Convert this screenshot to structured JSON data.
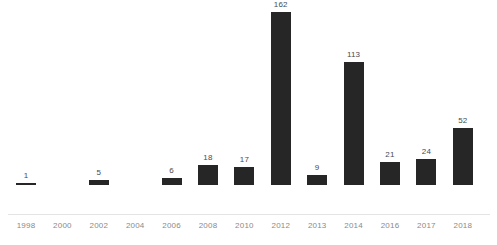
{
  "chart_data": {
    "type": "bar",
    "title": "",
    "subtitle": "",
    "xlabel": "",
    "ylabel": "",
    "grid": false,
    "legend": false,
    "legend_position": "none",
    "axis_line": true,
    "y_axis_visible": false,
    "ylim": [
      0,
      170
    ],
    "bar_color": "#262626",
    "label_color": "#4a4a4a",
    "tick_color": "#8a8a8a",
    "categories": [
      "1998",
      "2000",
      "2002",
      "2004",
      "2006",
      "2008",
      "2010",
      "2012",
      "2013",
      "2014",
      "2016",
      "2017",
      "2018"
    ],
    "values": [
      1,
      null,
      5,
      null,
      6,
      18,
      17,
      162,
      9,
      113,
      21,
      24,
      52
    ],
    "data_labels": [
      "1",
      "",
      "5",
      "",
      "6",
      "18",
      "17",
      "162",
      "9",
      "113",
      "21",
      "24",
      "52"
    ],
    "points": [
      {
        "category": "1998",
        "value": 1,
        "label": "1"
      },
      {
        "category": "2000",
        "value": null,
        "label": ""
      },
      {
        "category": "2002",
        "value": 5,
        "label": "5"
      },
      {
        "category": "2004",
        "value": null,
        "label": ""
      },
      {
        "category": "2006",
        "value": 6,
        "label": "6"
      },
      {
        "category": "2008",
        "value": 18,
        "label": "18"
      },
      {
        "category": "2010",
        "value": 17,
        "label": "17"
      },
      {
        "category": "2012",
        "value": 162,
        "label": "162"
      },
      {
        "category": "2013",
        "value": 9,
        "label": "9"
      },
      {
        "category": "2014",
        "value": 113,
        "label": "113"
      },
      {
        "category": "2016",
        "value": 21,
        "label": "21"
      },
      {
        "category": "2017",
        "value": 24,
        "label": "24"
      },
      {
        "category": "2018",
        "value": 52,
        "label": "52"
      }
    ]
  }
}
